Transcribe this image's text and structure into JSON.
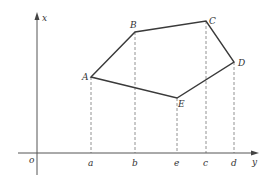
{
  "diagram": {
    "type": "coordinate-polygon",
    "colors": {
      "axis": "#555555",
      "polygon": "#3a3a3a",
      "dashed": "#777777",
      "background": "#ffffff"
    },
    "axes": {
      "vertical_label": "x",
      "horizontal_label": "y",
      "origin_label": "o"
    },
    "vertices": [
      {
        "label": "A",
        "px": 91,
        "py": 77
      },
      {
        "label": "B",
        "px": 135,
        "py": 32
      },
      {
        "label": "C",
        "px": 206,
        "py": 21
      },
      {
        "label": "D",
        "px": 234,
        "py": 62
      },
      {
        "label": "E",
        "px": 177,
        "py": 98
      }
    ],
    "polygon_order": [
      "A",
      "B",
      "C",
      "D",
      "E"
    ],
    "projections": [
      {
        "vertex": "A",
        "foot_label": "a"
      },
      {
        "vertex": "B",
        "foot_label": "b"
      },
      {
        "vertex": "E",
        "foot_label": "e"
      },
      {
        "vertex": "C",
        "foot_label": "c"
      },
      {
        "vertex": "D",
        "foot_label": "d"
      }
    ]
  }
}
